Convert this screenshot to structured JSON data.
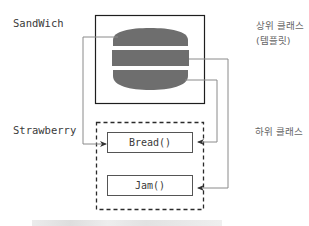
{
  "labels": {
    "sandwich": "SandWich",
    "strawberry": "Strawberry",
    "super_class_line1": "상위 클래스",
    "super_class_line2": "(템플릿)",
    "sub_class": "하위 클래스"
  },
  "methods": {
    "bread": "Bread()",
    "jam": "Jam()"
  },
  "caption": "",
  "colors": {
    "bun": "#6e6e6e",
    "line": "#8a8a8a",
    "frame": "#1e1e1e",
    "dash": "#2a2a2a"
  },
  "diagram": {
    "nodes": [
      {
        "id": "sandwich",
        "kind": "template-class",
        "label": "SandWich",
        "shape": "solid-box-with-burger"
      },
      {
        "id": "strawberry",
        "kind": "sub-class",
        "label": "Strawberry",
        "shape": "dashed-box"
      },
      {
        "id": "bread",
        "kind": "method",
        "label": "Bread()",
        "parent": "strawberry"
      },
      {
        "id": "jam",
        "kind": "method",
        "label": "Jam()",
        "parent": "strawberry"
      }
    ],
    "edges": [
      {
        "from": "sandwich.top-bun",
        "to": "bread",
        "side": "left"
      },
      {
        "from": "sandwich.bottom-bun",
        "to": "bread",
        "side": "right"
      },
      {
        "from": "sandwich.patty",
        "to": "jam",
        "side": "right"
      }
    ]
  }
}
